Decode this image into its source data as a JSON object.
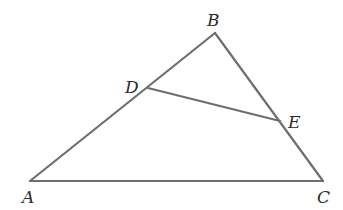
{
  "diagram": {
    "type": "geometry-triangle",
    "stroke_color": "#6e6e6e",
    "label_color": "#2a2a2a",
    "background": "#ffffff",
    "points": {
      "A": {
        "x": 30,
        "y": 181,
        "label": "A",
        "lx": 22,
        "ly": 203
      },
      "B": {
        "x": 215,
        "y": 33,
        "label": "B",
        "lx": 207,
        "ly": 26
      },
      "C": {
        "x": 323,
        "y": 181,
        "label": "C",
        "lx": 317,
        "ly": 203
      },
      "D": {
        "x": 148,
        "y": 88,
        "label": "D",
        "lx": 125,
        "ly": 93
      },
      "E": {
        "x": 280,
        "y": 121,
        "label": "E",
        "lx": 288,
        "ly": 128
      }
    },
    "segments": [
      {
        "from": "A",
        "to": "B"
      },
      {
        "from": "B",
        "to": "C"
      },
      {
        "from": "A",
        "to": "C"
      },
      {
        "from": "D",
        "to": "E"
      }
    ]
  }
}
